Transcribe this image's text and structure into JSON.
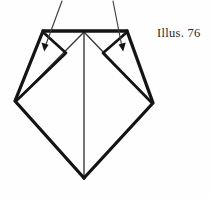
{
  "figure": {
    "caption": "Illus. 76",
    "background_color": "#fefefe",
    "ink_color": "#141414",
    "thin_line_color": "#3a3a3a"
  },
  "diagram": {
    "type": "line-drawing",
    "stroke_widths": {
      "outline": 3.2,
      "inner_fold": 2.6,
      "center_line": 1.4,
      "leader": 1.1
    },
    "vertices": {
      "top_left_corner": [
        43,
        31
      ],
      "top_center": [
        84,
        31
      ],
      "top_right_corner": [
        127,
        31
      ],
      "left_vertex": [
        15,
        101
      ],
      "right_vertex": [
        153,
        103
      ],
      "bottom_apex": [
        84,
        178
      ],
      "left_flap_point": [
        66,
        53
      ],
      "right_flap_point": [
        103,
        53
      ]
    },
    "edges": [
      {
        "name": "top-bar",
        "from": "top_left_corner",
        "to": "top_right_corner",
        "weight": "outline"
      },
      {
        "name": "left-upper-edge",
        "from": "top_left_corner",
        "to": "left_vertex",
        "weight": "outline"
      },
      {
        "name": "right-upper-edge",
        "from": "top_right_corner",
        "to": "right_vertex",
        "weight": "outline"
      },
      {
        "name": "left-lower-edge",
        "from": "left_vertex",
        "to": "bottom_apex",
        "weight": "outline"
      },
      {
        "name": "right-lower-edge",
        "from": "right_vertex",
        "to": "bottom_apex",
        "weight": "outline"
      },
      {
        "name": "left-flap-upper",
        "from": "top_left_corner",
        "to": "left_flap_point",
        "weight": "inner_fold"
      },
      {
        "name": "left-flap-lower",
        "from": "left_flap_point",
        "to": "left_vertex",
        "weight": "inner_fold"
      },
      {
        "name": "right-flap-upper",
        "from": "top_right_corner",
        "to": "right_flap_point",
        "weight": "inner_fold"
      },
      {
        "name": "right-flap-lower",
        "from": "right_flap_point",
        "to": "right_vertex",
        "weight": "inner_fold"
      },
      {
        "name": "left-diagonal-from-center",
        "from": "top_center",
        "to": "left_vertex",
        "weight": "center_line"
      },
      {
        "name": "right-diagonal-from-center",
        "from": "top_center",
        "to": "right_vertex",
        "weight": "center_line"
      },
      {
        "name": "center-vertical",
        "from": "top_center",
        "to": "bottom_apex",
        "weight": "center_line"
      }
    ],
    "leaders": [
      {
        "name": "left-leader",
        "start": [
          62,
          1
        ],
        "end": [
          44,
          49
        ],
        "arrow": "down-left"
      },
      {
        "name": "right-leader",
        "start": [
          113,
          1
        ],
        "end": [
          123,
          49
        ],
        "arrow": "down-right"
      }
    ]
  }
}
